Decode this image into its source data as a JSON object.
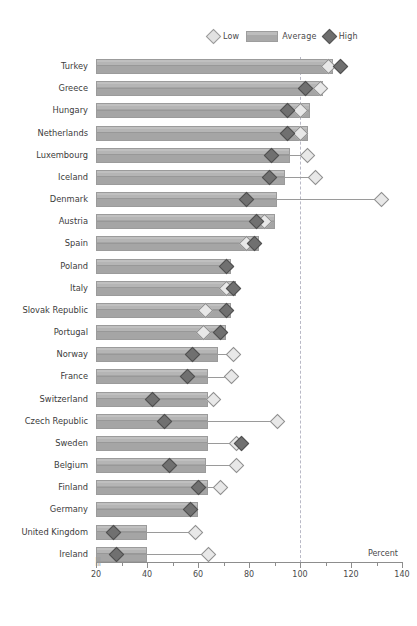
{
  "legend": {
    "items": [
      {
        "key": "low",
        "label": "Low",
        "icon": "diamond-light-icon",
        "color": "#e2e2e2"
      },
      {
        "key": "avg",
        "label": "Average",
        "icon": "bar-swatch-icon",
        "color": "#a9a9a9"
      },
      {
        "key": "high",
        "label": "High",
        "icon": "diamond-dark-icon",
        "color": "#6e6e6e"
      }
    ]
  },
  "axis": {
    "title": "Percent",
    "ticks": [
      20,
      40,
      60,
      80,
      100,
      120,
      140
    ],
    "minor_ticks": [
      30,
      50,
      70,
      90,
      110,
      130
    ],
    "break_symbol": "|||"
  },
  "chart_data": {
    "type": "bar",
    "title": "",
    "xlabel": "Percent",
    "ylabel": "",
    "xlim": [
      20,
      140
    ],
    "grid": true,
    "reference_line": 100,
    "legend_position": "top-right",
    "categories": [
      "Turkey",
      "Greece",
      "Hungary",
      "Netherlands",
      "Luxembourg",
      "Iceland",
      "Denmark",
      "Austria",
      "Spain",
      "Poland",
      "Italy",
      "Slovak Republic",
      "Portugal",
      "Norway",
      "France",
      "Switzerland",
      "Czech Republic",
      "Sweden",
      "Belgium",
      "Finland",
      "Germany",
      "United Kingdom",
      "Ireland"
    ],
    "series": [
      {
        "name": "Average",
        "values": [
          113,
          109,
          104,
          103,
          96,
          94,
          91,
          90,
          84,
          73,
          75,
          73,
          71,
          68,
          64,
          64,
          64,
          64,
          63,
          64,
          60,
          40,
          40
        ]
      },
      {
        "name": "Low",
        "values": [
          111,
          108,
          100,
          100,
          103,
          106,
          132,
          86,
          79,
          71,
          71,
          63,
          62,
          74,
          73,
          66,
          91,
          75,
          75,
          69,
          57,
          59,
          64
        ]
      },
      {
        "name": "High",
        "values": [
          116,
          102,
          95,
          95,
          89,
          88,
          79,
          83,
          82,
          71,
          74,
          71,
          69,
          58,
          56,
          42,
          47,
          77,
          49,
          60,
          57,
          27,
          28
        ]
      }
    ]
  }
}
